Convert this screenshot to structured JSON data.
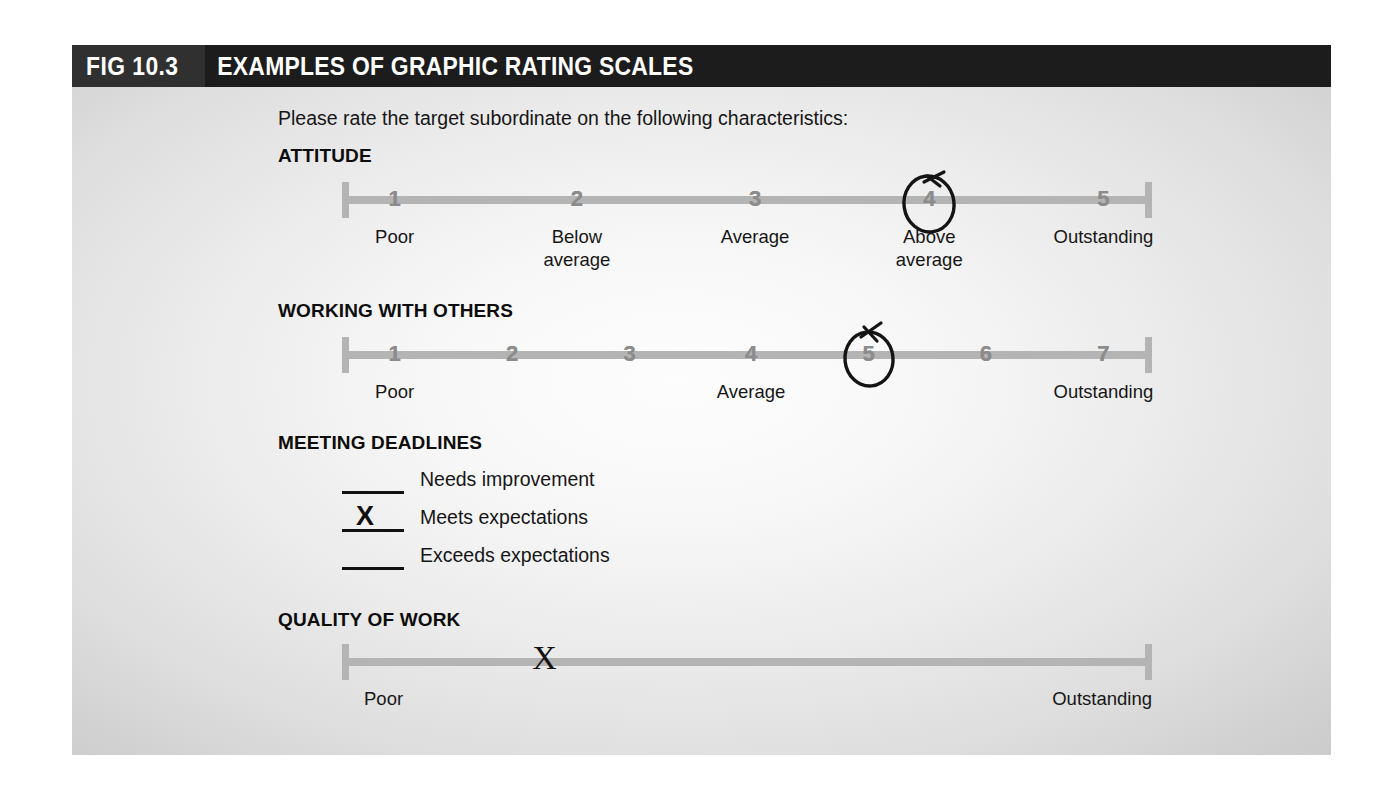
{
  "figure": {
    "number": "FIG 10.3",
    "title": "EXAMPLES OF GRAPHIC RATING SCALES",
    "header_bg": "#1c1c1c",
    "number_bg": "#303030",
    "header_text_color": "#ffffff",
    "panel_bg_center": "#fdfdfd",
    "panel_bg_edge": "#c9c9c9"
  },
  "instruction": "Please rate the target subordinate on the following characteristics:",
  "colors": {
    "scale_line": "#b4b4b4",
    "scale_number": "#8c8c8c",
    "annotation_ink": "#141414",
    "body_text": "#161616"
  },
  "sections": [
    {
      "id": "attitude",
      "title": "ATTITUDE",
      "type": "numeric-scale",
      "numbers": [
        "1",
        "2",
        "3",
        "4",
        "5"
      ],
      "anchors": [
        {
          "at": 1,
          "text": "Poor"
        },
        {
          "at": 2,
          "text": "Below\naverage"
        },
        {
          "at": 3,
          "text": "Average"
        },
        {
          "at": 4,
          "text": "Above\naverage"
        },
        {
          "at": 5,
          "text": "Outstanding"
        }
      ],
      "annotation": {
        "kind": "circle",
        "at": 4,
        "value": "4"
      }
    },
    {
      "id": "working-with-others",
      "title": "WORKING WITH OTHERS",
      "type": "numeric-scale",
      "numbers": [
        "1",
        "2",
        "3",
        "4",
        "5",
        "6",
        "7"
      ],
      "anchors": [
        {
          "at": 1,
          "text": "Poor"
        },
        {
          "at": 4,
          "text": "Average"
        },
        {
          "at": 7,
          "text": "Outstanding"
        }
      ],
      "annotation": {
        "kind": "circle",
        "at": 5,
        "value": "5"
      }
    },
    {
      "id": "meeting-deadlines",
      "title": "MEETING DEADLINES",
      "type": "checklist",
      "options": [
        {
          "label": "Needs improvement",
          "checked": false,
          "mark": ""
        },
        {
          "label": "Meets expectations",
          "checked": true,
          "mark": "X"
        },
        {
          "label": "Exceeds expectations",
          "checked": false,
          "mark": ""
        }
      ]
    },
    {
      "id": "quality-of-work",
      "title": "QUALITY OF WORK",
      "type": "continuous-scale",
      "anchors": [
        {
          "pos": 0,
          "text": "Poor"
        },
        {
          "pos": 100,
          "text": "Outstanding"
        }
      ],
      "annotation": {
        "kind": "x-mark",
        "value": "X",
        "position_pct": 25
      }
    }
  ]
}
